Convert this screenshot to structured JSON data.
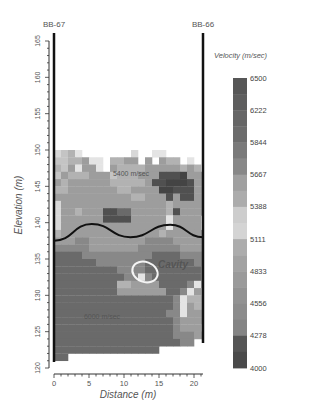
{
  "chart_data": {
    "type": "heatmap",
    "title": "",
    "xlabel": "Distance (m)",
    "ylabel": "Elevation (m)",
    "xlim": [
      0,
      21.3
    ],
    "ylim": [
      120,
      165
    ],
    "x_ticks": [
      0,
      5,
      10,
      15,
      20
    ],
    "y_ticks": [
      120,
      125,
      130,
      135,
      140,
      145,
      150,
      155,
      160,
      165
    ],
    "boreholes": [
      {
        "label": "BB-67",
        "x": 0
      },
      {
        "label": "BB-66",
        "x": 21.3
      }
    ],
    "colorbar": {
      "title": "Velocity (m/sec)",
      "levels": [
        6500,
        6222,
        5844,
        5667,
        5388,
        5111,
        4833,
        4556,
        4278,
        4000
      ],
      "colors": [
        "#5a5a5a",
        "#6a6a6a",
        "#8a8a8a",
        "#b0b0b0",
        "#d2d2d2",
        "#a8a8a8",
        "#8e8e8e",
        "#7c7c7c",
        "#4f4f4f",
        "#3e3e3e"
      ]
    },
    "annotations": [
      {
        "text": "5400 m/sec",
        "x": 8.5,
        "y": 146.5
      },
      {
        "text": "6000 m/sec",
        "x": 6.5,
        "y": 126.5
      },
      {
        "text": "Cavity",
        "x": 15.5,
        "y": 134.5
      }
    ],
    "boundary_curve": {
      "description": "sinusoidal interface between upper and lower zones",
      "points": [
        [
          0,
          137.5
        ],
        [
          5.4,
          139.8
        ],
        [
          10.9,
          138.0
        ],
        [
          16.6,
          139.7
        ],
        [
          21.3,
          138.0
        ]
      ]
    },
    "cavity_ellipse": {
      "cx": 13,
      "cy": 133,
      "rx": 1.9,
      "ry": 1.4
    },
    "grid": {
      "x0": 0,
      "dx": 1,
      "y_top": 151,
      "dy": 1,
      "rows": [
        "....................",
        "0124.......0..44....",
        "1122344.2233.3.322.4",
        "2134334.3222233333232",
        "1322233312223337778333",
        "3233333322222377888733",
        "2233333332233338877733",
        "3333333333322333737733",
        "0333333333333333233333",
        "0332333776633333273333",
        "033333377773333343333",
        "033333333333333343333",
        "2333333333333332333333",
        "3335533333333555533333",
        "5555533333335555553333",
        "6666555555555566665555",
        "6666665555555666666655",
        "6666666665555666666665",
        "6666666666554566666665",
        "6666666662233336666543",
        "6666666663333333665432",
        "6666666666666666654222",
        "6666666666666666654322",
        "6666666666666666554333",
        "6666666666666666653333",
        "6666666666666666653332",
        "6666666666666666655533",
        "66666666666666666655..",
        "666666666666666.......",
        "66...................."
      ],
      "value_map": {
        "0": "#d8d8d8",
        "1": "#c4c4c4",
        "2": "#b2b2b2",
        "3": "#9d9d9d",
        "4": "#e4e4e4",
        "5": "#888888",
        "6": "#6a6a6a",
        "7": "#505050",
        "8": "#444444"
      }
    }
  }
}
